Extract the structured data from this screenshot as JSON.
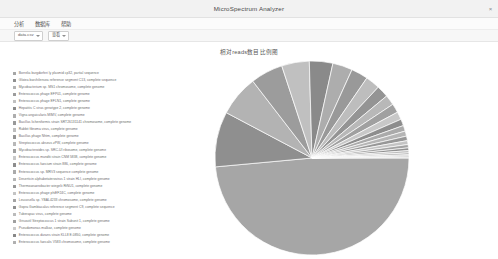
{
  "window": {
    "title": "MicroSpectrum Analyzer",
    "controls": [
      {
        "name": "close-button",
        "glyph": "×"
      }
    ]
  },
  "menubar": {
    "items": [
      {
        "name": "menu-analysis",
        "label": "分析"
      },
      {
        "name": "menu-database",
        "label": "数据库"
      },
      {
        "name": "menu-help",
        "label": "帮助"
      }
    ]
  },
  "toolbar": {
    "selects": [
      {
        "name": "file-select",
        "value": "data.csv"
      },
      {
        "name": "view-select",
        "value": "查看"
      }
    ]
  },
  "chart_data": {
    "type": "pie",
    "title": "相对reads数目比例图",
    "xlabel": "",
    "ylabel": "",
    "legend_position": "left",
    "grid": false,
    "categories": [
      "Borrelia burgdorferi ly plasmid cp32, partial sequence",
      "Gloiea barchilensea reference segment C13, complete sequence",
      "Mycobacterium sp. MS1 chromosome, complete genome",
      "Enterococcus phage EFP01, complete genome",
      "Enterococcus phage EFLN1, complete genome",
      "Hepatitis C virus genotype 2, complete genome",
      "Vigna anguicularis MIMV, complete genome",
      "Bacillus licheniformis strain SRT26131141 chromosome, complete genome",
      "Rabbit fibroma virus, complete genome",
      "Bacillus phage Nhtm, complete genome",
      "Streptococcus abseus zPW, complete genome",
      "Mycobacteroides sp. SRC-UI ribosome, complete genome",
      "Enterococcus mundtii strain CNM 5838, complete genome",
      "Enterococcus faecium strain 886, complete genome",
      "Enterococcus sp. MRV3 sequence complete genome",
      "Deserticin alphabetaterovirus 1 strain HLI, complete genome",
      "Thermoanaerobacter wiegelii RtNU1, complete genome",
      "Enterococcus phage phiEF24C, complete genome",
      "Leucosella sp. YBAL4233 chromosome, complete genome",
      "Gopra Gambiacalus reference segment C9, complete sequence",
      "Tuberapac virus, complete genome",
      "Grisoutil Streptococcus 1 strain Subunit 1, complete genome",
      "Pseudomonas malkoz, complete genome",
      "Enterococcus durans strain KLL8 E.0850, complete genome",
      "Enterococcus faecalis V583 chromosome, complete genome"
    ],
    "values": [
      48.5,
      9.2,
      6.8,
      5.4,
      4.6,
      3.9,
      3.3,
      2.8,
      2.4,
      2.0,
      1.7,
      1.5,
      1.3,
      1.1,
      0.95,
      0.85,
      0.75,
      0.65,
      0.55,
      0.45,
      0.38,
      0.3,
      0.24,
      0.18,
      0.12
    ],
    "colors": [
      "#a6a6a6",
      "#8f8f8f",
      "#b3b3b3",
      "#9c9c9c",
      "#c0c0c0",
      "#8a8a8a",
      "#adadad",
      "#999999",
      "#bdbdbd",
      "#949494",
      "#b8b8b8",
      "#a0a0a0",
      "#c8c8c8",
      "#8d8d8d",
      "#aaaaaa",
      "#b5b5b5",
      "#979797",
      "#c4c4c4",
      "#a3a3a3",
      "#909090",
      "#bbbbbb",
      "#9f9f9f",
      "#cbcbcb",
      "#878787",
      "#b0b0b0"
    ]
  }
}
